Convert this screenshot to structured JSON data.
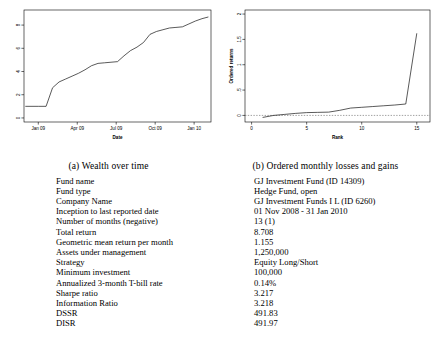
{
  "figures": [
    {
      "caption": "(a) Wealth over time",
      "chart_data": {
        "type": "line",
        "title": "",
        "xlabel": "Date",
        "ylabel": "",
        "xticklabels": [
          "Jan 09",
          "Apr 09",
          "Jul 09",
          "Oct 09",
          "Jan 10"
        ],
        "xtickvalues": [
          0,
          3,
          6,
          9,
          12
        ],
        "yticklabels": [
          "0",
          "2",
          "4",
          "6",
          "8"
        ],
        "ytickvalues": [
          0,
          2,
          4,
          6,
          8
        ],
        "xlim": [
          -1.1,
          13.3
        ],
        "ylim": [
          -0.35,
          9.3
        ],
        "grid": false,
        "legend": "none",
        "x": [
          -1.0,
          0.0,
          0.6,
          1.1,
          1.6,
          2.1,
          2.6,
          3.1,
          3.6,
          4.1,
          4.6,
          5.1,
          5.6,
          6.1,
          6.6,
          7.1,
          7.6,
          8.1,
          8.6,
          9.1,
          9.6,
          10.1,
          10.6,
          11.1,
          11.6,
          12.1,
          12.6,
          13.1
        ],
        "y": [
          1.0,
          1.0,
          1.0,
          2.6,
          3.1,
          3.35,
          3.6,
          3.85,
          4.15,
          4.5,
          4.7,
          4.75,
          4.8,
          4.85,
          5.35,
          5.8,
          6.1,
          6.5,
          7.2,
          7.45,
          7.6,
          7.75,
          7.8,
          7.85,
          8.1,
          8.35,
          8.55,
          8.7
        ]
      }
    },
    {
      "caption": "(b) Ordered monthly losses and gains",
      "chart_data": {
        "type": "line",
        "title": "",
        "xlabel": "Rank",
        "ylabel": "Ordered returns",
        "xticklabels": [
          "0",
          "5",
          "10",
          "15"
        ],
        "xtickvalues": [
          0,
          5,
          10,
          15
        ],
        "yticklabels": [
          "0",
          ".5",
          "1",
          "1.5",
          "2"
        ],
        "ytickvalues": [
          0,
          0.5,
          1,
          1.5,
          2
        ],
        "xlim": [
          -0.6,
          16.2
        ],
        "ylim": [
          -0.13,
          2.08
        ],
        "grid": false,
        "legend": "none",
        "zero_reference_line": 0,
        "x": [
          1,
          2,
          3,
          4,
          5,
          6,
          7,
          8,
          9,
          10,
          11,
          12,
          13,
          14,
          15
        ],
        "y": [
          -0.04,
          0.0,
          0.02,
          0.04,
          0.055,
          0.06,
          0.065,
          0.1,
          0.145,
          0.16,
          0.175,
          0.19,
          0.205,
          0.225,
          1.62
        ]
      }
    }
  ],
  "fund_table": {
    "rows": [
      {
        "label": "Fund name",
        "value": "GJ Investment Fund (ID 14309)"
      },
      {
        "label": "Fund type",
        "value": "Hedge Fund, open"
      },
      {
        "label": "Company Name",
        "value": "GJ Investment Funds I L (ID 6260)"
      },
      {
        "label": "Inception to last reported date",
        "value": "01 Nov 2008 - 31 Jan 2010"
      },
      {
        "label": "Number of months (negative)",
        "value": "13 (1)"
      },
      {
        "label": "Total return",
        "value": "8.708"
      },
      {
        "label": "Geometric mean return per month",
        "value": "1.155"
      },
      {
        "label": "Assets under management",
        "value": "1,250,000"
      },
      {
        "label": "Strategy",
        "value": "Equity Long/Short"
      },
      {
        "label": "Minimum investment",
        "value": "100,000"
      },
      {
        "label": "Annualized 3-month T-bill rate",
        "value": "0.14%"
      },
      {
        "label": "Sharpe ratio",
        "value": "3.217"
      },
      {
        "label": "Information Ratio",
        "value": "3.218"
      },
      {
        "label": "DSSR",
        "value": "491.83"
      },
      {
        "label": "DISR",
        "value": "491.97"
      }
    ]
  }
}
